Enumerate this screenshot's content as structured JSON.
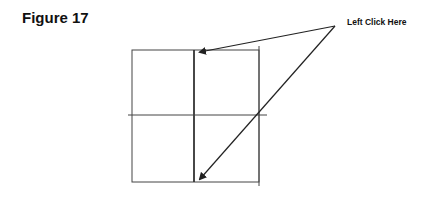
{
  "figure": {
    "title": "Figure 17",
    "callout_label": "Left Click Here"
  },
  "colors": {
    "line": "#333333",
    "text": "#111111"
  }
}
